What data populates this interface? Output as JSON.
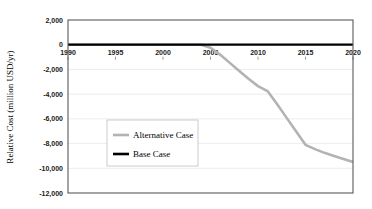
{
  "chart_data": {
    "type": "line",
    "title": "",
    "xlabel": "",
    "ylabel": "Relative Cost (million USD/yr)",
    "xlim": [
      1990,
      2020
    ],
    "ylim": [
      -12000,
      2000
    ],
    "xticks": [
      "1990",
      "1995",
      "2000",
      "2005",
      "2010",
      "2015",
      "2020"
    ],
    "xtick_values": [
      1990,
      1995,
      2000,
      2005,
      2010,
      2015,
      2020
    ],
    "yticks": [
      "2,000",
      "0",
      "-2,000",
      "-4,000",
      "-6,000",
      "-8,000",
      "-10,000",
      "-12,000"
    ],
    "ytick_values": [
      2000,
      0,
      -2000,
      -4000,
      -6000,
      -8000,
      -10000,
      -12000
    ],
    "grid": "horizontal",
    "legend_position": "center-left",
    "series": [
      {
        "name": "Alternative Case",
        "color": "#b3b3b3",
        "x": [
          1990,
          1995,
          2000,
          2004,
          2005,
          2006,
          2007,
          2008,
          2009,
          2010,
          2011,
          2012,
          2013,
          2014,
          2015,
          2016,
          2017,
          2018,
          2019,
          2020
        ],
        "values": [
          0,
          0,
          0,
          0,
          -250,
          -800,
          -1450,
          -2100,
          -2750,
          -3350,
          -3750,
          -4800,
          -5900,
          -7000,
          -8100,
          -8450,
          -8750,
          -9000,
          -9250,
          -9500
        ]
      },
      {
        "name": "Base Case",
        "color": "#000000",
        "x": [
          1990,
          2020
        ],
        "values": [
          0,
          0
        ]
      }
    ]
  },
  "legend": {
    "items": [
      {
        "label": "Alternative Case"
      },
      {
        "label": "Base Case"
      }
    ]
  },
  "axes": {
    "y_axis_title": "Relative Cost (million USD/yr)"
  }
}
